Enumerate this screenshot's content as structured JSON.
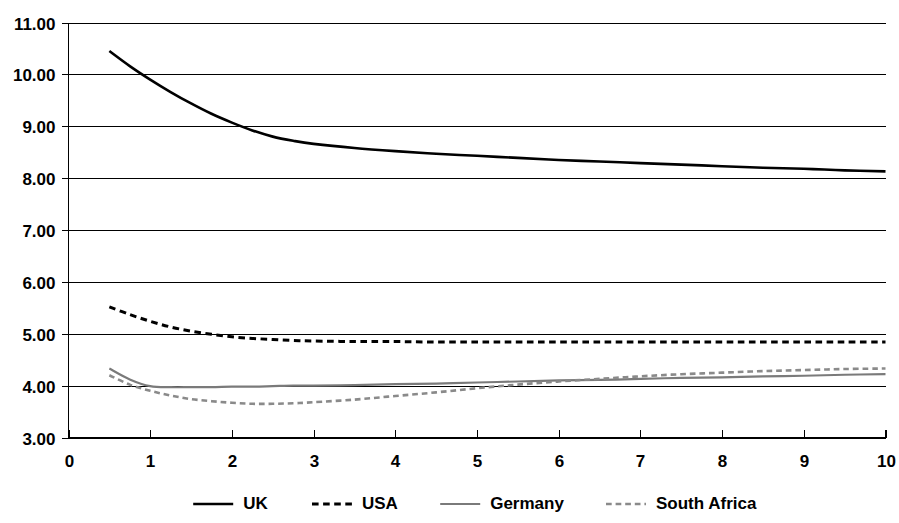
{
  "chart_data": {
    "type": "line",
    "title": "",
    "subtitle": "",
    "xlabel": "",
    "ylabel": "",
    "xlim": [
      0,
      10
    ],
    "ylim": [
      3.0,
      11.0
    ],
    "grid": true,
    "legend_position": "bottom",
    "x_ticks": [
      "0",
      "1",
      "2",
      "3",
      "4",
      "5",
      "6",
      "7",
      "8",
      "9",
      "10"
    ],
    "y_ticks": [
      "3.00",
      "4.00",
      "5.00",
      "6.00",
      "7.00",
      "8.00",
      "9.00",
      "10.00",
      "11.00"
    ],
    "x": [
      0.5,
      0.75,
      1.0,
      1.25,
      1.5,
      1.75,
      2.0,
      2.25,
      2.5,
      2.75,
      3.0,
      3.5,
      4.0,
      4.5,
      5.0,
      5.5,
      6.0,
      6.5,
      7.0,
      7.5,
      8.0,
      8.5,
      9.0,
      9.5,
      10.0
    ],
    "series": [
      {
        "name": "UK",
        "color": "#000000",
        "style": "solid",
        "width": 2.6,
        "values": [
          10.45,
          10.16,
          9.9,
          9.66,
          9.44,
          9.24,
          9.07,
          8.92,
          8.8,
          8.72,
          8.66,
          8.58,
          8.52,
          8.47,
          8.43,
          8.39,
          8.35,
          8.32,
          8.29,
          8.26,
          8.23,
          8.2,
          8.18,
          8.15,
          8.13
        ]
      },
      {
        "name": "USA",
        "color": "#000000",
        "style": "dashed",
        "width": 3.0,
        "values": [
          5.52,
          5.37,
          5.24,
          5.13,
          5.05,
          4.99,
          4.94,
          4.91,
          4.89,
          4.87,
          4.86,
          4.85,
          4.85,
          4.84,
          4.84,
          4.84,
          4.84,
          4.84,
          4.84,
          4.84,
          4.84,
          4.84,
          4.84,
          4.84,
          4.84
        ]
      },
      {
        "name": "Germany",
        "color": "#7a7a7a",
        "style": "solid",
        "width": 2.2,
        "values": [
          4.33,
          4.12,
          3.99,
          3.97,
          3.97,
          3.97,
          3.98,
          3.98,
          3.99,
          4.0,
          4.0,
          4.01,
          4.03,
          4.04,
          4.06,
          4.08,
          4.1,
          4.11,
          4.13,
          4.15,
          4.16,
          4.18,
          4.19,
          4.21,
          4.22
        ]
      },
      {
        "name": "South Africa",
        "color": "#8a8a8a",
        "style": "dashed",
        "width": 2.6,
        "values": [
          4.2,
          4.02,
          3.9,
          3.81,
          3.74,
          3.7,
          3.67,
          3.65,
          3.65,
          3.66,
          3.68,
          3.73,
          3.8,
          3.87,
          3.95,
          4.02,
          4.08,
          4.13,
          4.18,
          4.22,
          4.25,
          4.28,
          4.3,
          4.32,
          4.33
        ]
      }
    ],
    "legend": [
      {
        "label": "UK",
        "color": "#000000",
        "style": "solid"
      },
      {
        "label": "USA",
        "color": "#000000",
        "style": "dashed"
      },
      {
        "label": "Germany",
        "color": "#7a7a7a",
        "style": "solid"
      },
      {
        "label": "South Africa",
        "color": "#8a8a8a",
        "style": "dashed"
      }
    ]
  }
}
